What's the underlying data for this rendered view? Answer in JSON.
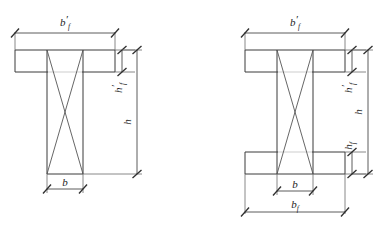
{
  "figure": {
    "background_color": "#ffffff",
    "line_color": "#3a3a3a",
    "dimension_line_color": "#4a4a4a",
    "label_color": "#1d1d1d"
  },
  "labels": {
    "b": "b",
    "b_f": "b",
    "b_f_sub": "f",
    "b_f_prime": "b",
    "b_f_prime_sub": "f",
    "b_f_prime_mark": "′",
    "h": "h",
    "h_f": "h",
    "h_f_sub": "f",
    "h_f_prime": "h",
    "h_f_prime_sub": "f",
    "h_f_prime_mark": "′"
  },
  "sections": [
    {
      "id": "t-section",
      "name": "T-shaped section",
      "dimensions_shown": [
        "b_f_prime",
        "h_f_prime",
        "h",
        "b"
      ],
      "flange": {
        "x": 15,
        "y": 50,
        "width": 100,
        "height": 22
      },
      "web": {
        "x": 47,
        "y": 50,
        "width": 36,
        "height": 124
      },
      "web_bottom_y": 174
    },
    {
      "id": "i-section",
      "name": "I-shaped section",
      "dimensions_shown": [
        "b_f_prime",
        "h_f_prime",
        "h",
        "h_f",
        "b",
        "b_f"
      ],
      "top_flange": {
        "x": 245,
        "y": 50,
        "width": 100,
        "height": 22
      },
      "bottom_flange": {
        "x": 245,
        "y": 152,
        "width": 100,
        "height": 22
      },
      "web": {
        "x": 277,
        "y": 50,
        "width": 36,
        "height": 124
      }
    }
  ],
  "dimension_annotations": {
    "t_section": [
      {
        "label_key": "b_f_prime",
        "orientation": "horizontal",
        "position": "above-flange"
      },
      {
        "label_key": "h_f_prime",
        "orientation": "vertical",
        "position": "right-of-flange"
      },
      {
        "label_key": "h",
        "orientation": "vertical",
        "position": "far-right"
      },
      {
        "label_key": "b",
        "orientation": "horizontal",
        "position": "below-web"
      }
    ],
    "i_section": [
      {
        "label_key": "b_f_prime",
        "orientation": "horizontal",
        "position": "above-top-flange"
      },
      {
        "label_key": "h_f_prime",
        "orientation": "vertical",
        "position": "right-of-top-flange"
      },
      {
        "label_key": "h",
        "orientation": "vertical",
        "position": "far-right"
      },
      {
        "label_key": "h_f",
        "orientation": "vertical",
        "position": "right-of-bottom-flange"
      },
      {
        "label_key": "b",
        "orientation": "horizontal",
        "position": "below-web"
      },
      {
        "label_key": "b_f",
        "orientation": "horizontal",
        "position": "below-bottom-flange"
      }
    ]
  }
}
